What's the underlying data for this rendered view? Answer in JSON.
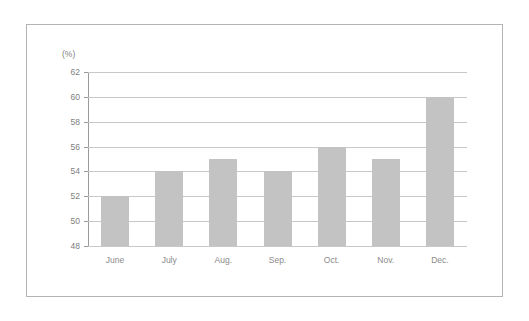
{
  "chart_data": {
    "type": "bar",
    "title": "",
    "xlabel": "",
    "ylabel": "(%)",
    "unit_label": "(%)",
    "categories": [
      "June",
      "July",
      "Aug.",
      "Sep.",
      "Oct.",
      "Nov.",
      "Dec."
    ],
    "values": [
      52,
      54,
      55,
      54,
      56,
      55,
      60
    ],
    "series": [
      {
        "name": "",
        "values": [
          52,
          54,
          55,
          54,
          56,
          55,
          60
        ]
      }
    ],
    "ylim": [
      48,
      62
    ],
    "ytick_step": 2,
    "yticks": [
      62,
      60,
      58,
      56,
      54,
      52,
      50,
      48
    ],
    "ytick_labels": [
      "62",
      "60",
      "58",
      "56",
      "54",
      "52",
      "50",
      "48"
    ],
    "grid": true,
    "legend": false,
    "legend_position": "none",
    "bar_color": "#c3c3c3",
    "gridline_color": "#c8c8c8",
    "axis_color": "#9a9a9a",
    "frame_color": "#b4b4b4",
    "background_color": "#ffffff"
  }
}
